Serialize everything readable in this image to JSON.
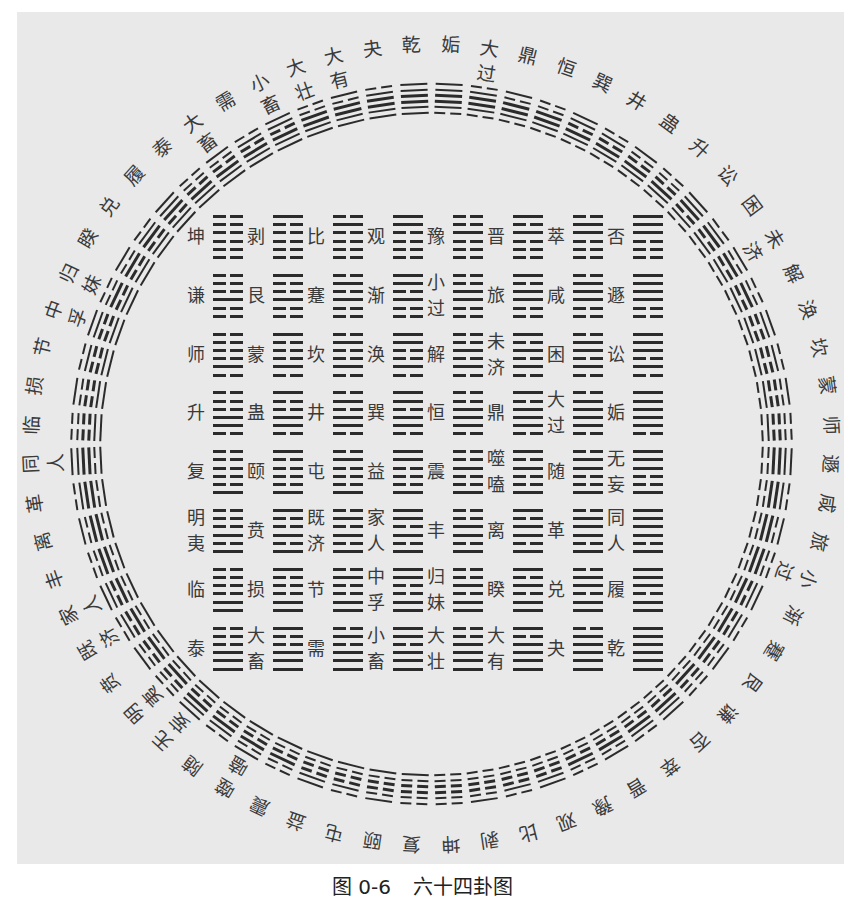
{
  "figure": {
    "caption_number": "图 0-6",
    "caption_title": "六十四卦图"
  },
  "colors": {
    "paper": "#e9e9e9",
    "ink": "#2b2b2b",
    "text": "#3a3a3a"
  },
  "circle": {
    "hexagrams": [
      {
        "name": "姤",
        "lines": "011111"
      },
      {
        "name": "大过",
        "lines": "011110"
      },
      {
        "name": "鼎",
        "lines": "011101"
      },
      {
        "name": "恒",
        "lines": "011100"
      },
      {
        "name": "巽",
        "lines": "011011"
      },
      {
        "name": "井",
        "lines": "011010"
      },
      {
        "name": "蛊",
        "lines": "011001"
      },
      {
        "name": "升",
        "lines": "011000"
      },
      {
        "name": "讼",
        "lines": "010111"
      },
      {
        "name": "困",
        "lines": "010110"
      },
      {
        "name": "未济",
        "lines": "010101"
      },
      {
        "name": "解",
        "lines": "010100"
      },
      {
        "name": "涣",
        "lines": "010011"
      },
      {
        "name": "坎",
        "lines": "010010"
      },
      {
        "name": "蒙",
        "lines": "010001"
      },
      {
        "name": "师",
        "lines": "010000"
      },
      {
        "name": "遯",
        "lines": "001111"
      },
      {
        "name": "咸",
        "lines": "001110"
      },
      {
        "name": "旅",
        "lines": "001101"
      },
      {
        "name": "小过",
        "lines": "001100"
      },
      {
        "name": "渐",
        "lines": "001011"
      },
      {
        "name": "蹇",
        "lines": "001010"
      },
      {
        "name": "艮",
        "lines": "001001"
      },
      {
        "name": "谦",
        "lines": "001000"
      },
      {
        "name": "否",
        "lines": "000111"
      },
      {
        "name": "萃",
        "lines": "000110"
      },
      {
        "name": "晋",
        "lines": "000101"
      },
      {
        "name": "豫",
        "lines": "000100"
      },
      {
        "name": "观",
        "lines": "000011"
      },
      {
        "name": "比",
        "lines": "000010"
      },
      {
        "name": "剥",
        "lines": "000001"
      },
      {
        "name": "坤",
        "lines": "000000"
      },
      {
        "name": "复",
        "lines": "100000"
      },
      {
        "name": "颐",
        "lines": "100001"
      },
      {
        "name": "屯",
        "lines": "100010"
      },
      {
        "name": "益",
        "lines": "100011"
      },
      {
        "name": "震",
        "lines": "100100"
      },
      {
        "name": "噬嗑",
        "lines": "100101"
      },
      {
        "name": "随",
        "lines": "100110"
      },
      {
        "name": "无妄",
        "lines": "100111"
      },
      {
        "name": "明夷",
        "lines": "101000"
      },
      {
        "name": "贲",
        "lines": "101001"
      },
      {
        "name": "既济",
        "lines": "101010"
      },
      {
        "name": "家人",
        "lines": "101011"
      },
      {
        "name": "丰",
        "lines": "101100"
      },
      {
        "name": "离",
        "lines": "101101"
      },
      {
        "name": "革",
        "lines": "101110"
      },
      {
        "name": "同人",
        "lines": "101111"
      },
      {
        "name": "临",
        "lines": "110000"
      },
      {
        "name": "损",
        "lines": "110001"
      },
      {
        "name": "节",
        "lines": "110010"
      },
      {
        "name": "中孚",
        "lines": "110011"
      },
      {
        "name": "归妹",
        "lines": "110100"
      },
      {
        "name": "睽",
        "lines": "110101"
      },
      {
        "name": "兑",
        "lines": "110110"
      },
      {
        "name": "履",
        "lines": "110111"
      },
      {
        "name": "泰",
        "lines": "111000"
      },
      {
        "name": "大畜",
        "lines": "111001"
      },
      {
        "name": "需",
        "lines": "111010"
      },
      {
        "name": "小畜",
        "lines": "111011"
      },
      {
        "name": "大壮",
        "lines": "111100"
      },
      {
        "name": "大有",
        "lines": "111101"
      },
      {
        "name": "夬",
        "lines": "111110"
      },
      {
        "name": "乾",
        "lines": "111111"
      }
    ]
  },
  "square": {
    "rows": [
      [
        {
          "name": "坤",
          "lines": "000000"
        },
        {
          "name": "剥",
          "lines": "000001"
        },
        {
          "name": "比",
          "lines": "000010"
        },
        {
          "name": "观",
          "lines": "000011"
        },
        {
          "name": "豫",
          "lines": "000100"
        },
        {
          "name": "晋",
          "lines": "000101"
        },
        {
          "name": "萃",
          "lines": "000110"
        },
        {
          "name": "否",
          "lines": "000111"
        }
      ],
      [
        {
          "name": "谦",
          "lines": "001000"
        },
        {
          "name": "艮",
          "lines": "001001"
        },
        {
          "name": "蹇",
          "lines": "001010"
        },
        {
          "name": "渐",
          "lines": "001011"
        },
        {
          "name": "小过",
          "lines": "001100"
        },
        {
          "name": "旅",
          "lines": "001101"
        },
        {
          "name": "咸",
          "lines": "001110"
        },
        {
          "name": "遯",
          "lines": "001111"
        }
      ],
      [
        {
          "name": "师",
          "lines": "010000"
        },
        {
          "name": "蒙",
          "lines": "010001"
        },
        {
          "name": "坎",
          "lines": "010010"
        },
        {
          "name": "涣",
          "lines": "010011"
        },
        {
          "name": "解",
          "lines": "010100"
        },
        {
          "name": "未济",
          "lines": "010101"
        },
        {
          "name": "困",
          "lines": "010110"
        },
        {
          "name": "讼",
          "lines": "010111"
        }
      ],
      [
        {
          "name": "升",
          "lines": "011000"
        },
        {
          "name": "蛊",
          "lines": "011001"
        },
        {
          "name": "井",
          "lines": "011010"
        },
        {
          "name": "巽",
          "lines": "011011"
        },
        {
          "name": "恒",
          "lines": "011100"
        },
        {
          "name": "鼎",
          "lines": "011101"
        },
        {
          "name": "大过",
          "lines": "011110"
        },
        {
          "name": "姤",
          "lines": "011111"
        }
      ],
      [
        {
          "name": "复",
          "lines": "100000"
        },
        {
          "name": "颐",
          "lines": "100001"
        },
        {
          "name": "屯",
          "lines": "100010"
        },
        {
          "name": "益",
          "lines": "100011"
        },
        {
          "name": "震",
          "lines": "100100"
        },
        {
          "name": "噬嗑",
          "lines": "100101"
        },
        {
          "name": "随",
          "lines": "100110"
        },
        {
          "name": "无妄",
          "lines": "100111"
        }
      ],
      [
        {
          "name": "明夷",
          "lines": "101000"
        },
        {
          "name": "贲",
          "lines": "101001"
        },
        {
          "name": "既济",
          "lines": "101010"
        },
        {
          "name": "家人",
          "lines": "101011"
        },
        {
          "name": "丰",
          "lines": "101100"
        },
        {
          "name": "离",
          "lines": "101101"
        },
        {
          "name": "革",
          "lines": "101110"
        },
        {
          "name": "同人",
          "lines": "101111"
        }
      ],
      [
        {
          "name": "临",
          "lines": "110000"
        },
        {
          "name": "损",
          "lines": "110001"
        },
        {
          "name": "节",
          "lines": "110010"
        },
        {
          "name": "中孚",
          "lines": "110011"
        },
        {
          "name": "归妹",
          "lines": "110100"
        },
        {
          "name": "睽",
          "lines": "110101"
        },
        {
          "name": "兑",
          "lines": "110110"
        },
        {
          "name": "履",
          "lines": "110111"
        }
      ],
      [
        {
          "name": "泰",
          "lines": "111000"
        },
        {
          "name": "大畜",
          "lines": "111001"
        },
        {
          "name": "需",
          "lines": "111010"
        },
        {
          "name": "小畜",
          "lines": "111011"
        },
        {
          "name": "大壮",
          "lines": "111100"
        },
        {
          "name": "大有",
          "lines": "111101"
        },
        {
          "name": "夬",
          "lines": "111110"
        },
        {
          "name": "乾",
          "lines": "111111"
        }
      ]
    ]
  }
}
